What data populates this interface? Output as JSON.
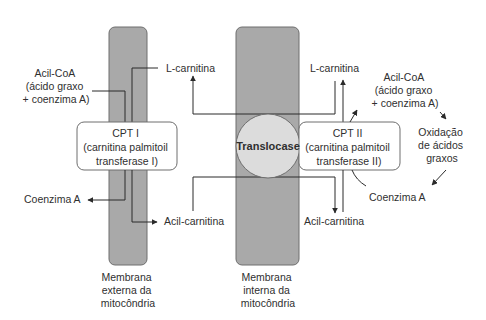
{
  "diagram": {
    "colors": {
      "membrane_fill": "#a9a9a9",
      "membrane_stroke": "#6e6e6e",
      "translocase_fill": "#dcdcdc",
      "box_fill": "#ffffff",
      "line": "#2a2a2a"
    },
    "membranes": {
      "outer": {
        "label_lines": [
          "Membrana",
          "externa da",
          "mitocôndria"
        ]
      },
      "inner": {
        "label_lines": [
          "Membrana",
          "interna da",
          "mitocôndria"
        ]
      }
    },
    "enzymes": {
      "cpt1": {
        "lines": [
          "CPT I",
          "(carnitina palmitoil",
          "transferase I)"
        ]
      },
      "translocase": {
        "label": "Translocase"
      },
      "cpt2": {
        "lines": [
          "CPT II",
          "(carnitina palmitoil",
          "transferase II)"
        ]
      }
    },
    "left_labels": {
      "acyl_coa": [
        "Acil-CoA",
        "(ácido graxo",
        "+ coenzima A)"
      ],
      "l_carnitine": "L-carnitina",
      "coenzyme_a": "Coenzima A",
      "acyl_carnitine": "Acil-carnitina"
    },
    "center_labels": {
      "l_carnitine": "L-carnitina"
    },
    "right_labels": {
      "l_carnitine": "L-carnitina",
      "acyl_coa": [
        "Acil-CoA",
        "(ácido graxo",
        "+ coenzima A)"
      ],
      "oxidation": [
        "Oxidação",
        "de ácidos",
        "graxos"
      ],
      "coenzyme_a": "Coenzima A",
      "acyl_carnitine": "Acil-carnitina"
    }
  }
}
